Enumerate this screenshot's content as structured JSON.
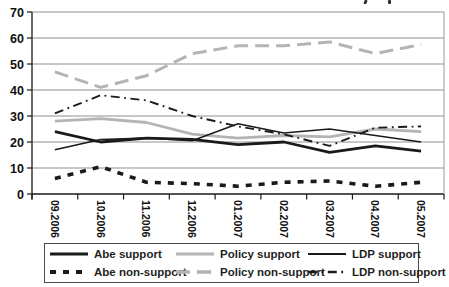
{
  "chart_data": {
    "type": "line",
    "title": "",
    "categories": [
      "09.2006",
      "10.2006",
      "11.2006",
      "12.2006",
      "01.2007",
      "02.2007",
      "03.2007",
      "04.2007",
      "05.2007"
    ],
    "y_axis": {
      "min": 0,
      "max": 70,
      "tick_step": 10,
      "tick_labels": [
        "0",
        "10",
        "20",
        "30",
        "40",
        "50",
        "60",
        "70"
      ]
    },
    "x_axis": {
      "label_rotation_deg": 90
    },
    "grid": true,
    "legend_position": "bottom-box",
    "series": [
      {
        "name": "Abe support",
        "color": "#1a1a1a",
        "stroke_width": 2.8,
        "dash": "",
        "values": [
          24,
          20,
          21.5,
          21,
          19,
          20,
          16,
          18.5,
          16.5
        ]
      },
      {
        "name": "Abe non-support",
        "color": "#1a1a1a",
        "stroke_width": 3.6,
        "dash": "6 7",
        "values": [
          6,
          10.5,
          4.5,
          4,
          3,
          4.5,
          5,
          3,
          4.5
        ]
      },
      {
        "name": "Policy support",
        "color": "#b4b4b4",
        "stroke_width": 2.8,
        "dash": "",
        "values": [
          28,
          29,
          27.5,
          23,
          21.5,
          22.5,
          22,
          25,
          24
        ]
      },
      {
        "name": "Policy non-support",
        "color": "#b4b4b4",
        "stroke_width": 3.0,
        "dash": "14 7",
        "values": [
          47,
          41,
          45.5,
          54,
          57,
          57,
          58.5,
          54,
          57.5
        ]
      },
      {
        "name": "LDP support",
        "color": "#1a1a1a",
        "stroke_width": 1.5,
        "dash": "",
        "values": [
          17,
          21,
          21.5,
          20.5,
          27,
          23.5,
          25,
          22.5,
          20
        ]
      },
      {
        "name": "LDP non-support",
        "color": "#1a1a1a",
        "stroke_width": 1.9,
        "dash": "9 4.5 1.8 4.5",
        "values": [
          31,
          38,
          36,
          30,
          26,
          23,
          18.5,
          25.5,
          26
        ]
      }
    ],
    "legend_order": [
      0,
      2,
      4,
      1,
      3,
      5
    ],
    "draw_order": [
      2,
      3,
      1,
      5,
      4,
      0
    ]
  },
  "colors": {
    "background": "#ffffff",
    "grid": "#8f8f8f",
    "plot_border": "#9a9a9a",
    "axis": "#1a1a1a",
    "tick_label": "#111111"
  }
}
